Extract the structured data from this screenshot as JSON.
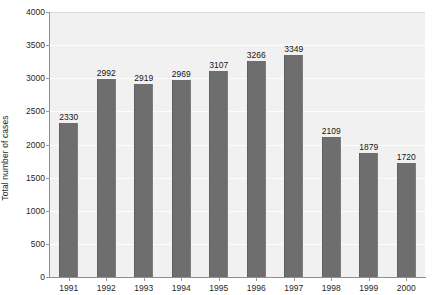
{
  "chart_data": {
    "type": "bar",
    "title": "",
    "subtitle": "",
    "xlabel": "",
    "ylabel": "Total number of cases",
    "categories": [
      "1991",
      "1992",
      "1993",
      "1994",
      "1995",
      "1996",
      "1997",
      "1998",
      "1999",
      "2000"
    ],
    "values": [
      2330,
      2992,
      2919,
      2969,
      3107,
      3266,
      3349,
      2109,
      1879,
      1720
    ],
    "data_labels": [
      "2330",
      "2992",
      "2919",
      "2969",
      "3107",
      "3266",
      "3349",
      "2109",
      "1879",
      "1720"
    ],
    "ylim": [
      0,
      4000
    ],
    "y_ticks": [
      0,
      500,
      1000,
      1500,
      2000,
      2500,
      3000,
      3500,
      4000
    ],
    "y_tick_labels": [
      "0",
      "500",
      "1000",
      "1500",
      "2000",
      "2500",
      "3000",
      "3500",
      "4000"
    ],
    "grid": true,
    "grid_axis": "y",
    "legend": false,
    "legend_position": "none",
    "bar_color": "#6e6e6e",
    "plot_background": "#f1f1f1",
    "gridline_color": "#fdfdfd",
    "axis_color": "#8f8f8f",
    "text_color": "#1f1f1f"
  }
}
